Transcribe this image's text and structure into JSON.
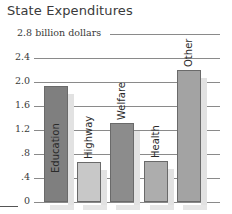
{
  "chart_data": {
    "type": "bar",
    "title": "State Expenditures",
    "xlabel": "",
    "ylabel": "billion dollars",
    "categories": [
      "Education",
      "Highway",
      "Welfare",
      "Health",
      "Other"
    ],
    "values": [
      1.93,
      0.67,
      1.31,
      0.68,
      2.2
    ],
    "ylim": [
      0,
      2.8
    ],
    "yticks": [
      0,
      0.4,
      0.8,
      1.2,
      1.6,
      2.0,
      2.4,
      2.8
    ],
    "ytick_labels": [
      "0",
      ".4",
      ".8",
      "1.2",
      "1.6",
      "2.0",
      "2.4",
      "2.8 billion dollars"
    ],
    "grid": true,
    "legend": "none",
    "bar_colors": [
      "#7f7f7f",
      "#c8c8c8",
      "#8c8c8c",
      "#adadad",
      "#a3a3a3"
    ]
  },
  "title": "State Expenditures"
}
